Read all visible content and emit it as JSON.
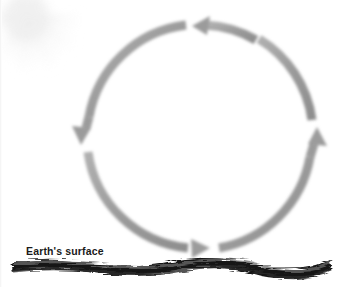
{
  "figure": {
    "width": 337,
    "height": 287,
    "background_color": "#ffffff"
  },
  "labels": {
    "surface": "Earth's surface"
  },
  "colors": {
    "arrow_gray": "#9a9a9a",
    "arrow_gray_light": "#b4b4b4",
    "arrow_gray_dark": "#808080",
    "ground_dark": "#1a1a1a",
    "ground_mid": "#5c5c5c",
    "sun_tint": "#e9e9e9",
    "label_text": "#1a1a1a"
  },
  "sun": {
    "name": "sun",
    "center_x": 26,
    "center_y": 18,
    "core_radius": 30,
    "ray_count": 12,
    "ray_length": 44,
    "opacity": 0.55
  },
  "cycle": {
    "name": "convection-cycle",
    "direction": "counterclockwise",
    "center_x": 200,
    "center_y": 137,
    "radius": 112,
    "stroke_width": 9,
    "arrows": [
      {
        "id": "top-arrow",
        "name": "cycle-arrow-top",
        "points": "left",
        "glyph": "←",
        "start_angle": 300,
        "end_angle": 188,
        "tip_x": 193,
        "tip_y": 26
      },
      {
        "id": "left-arrow",
        "name": "cycle-arrow-left",
        "points": "down",
        "glyph": "↓",
        "start_angle": 182,
        "end_angle": 93,
        "tip_x": 82,
        "tip_y": 144
      },
      {
        "id": "bottom-arrow",
        "name": "cycle-arrow-bottom",
        "points": "right",
        "glyph": "→",
        "start_angle": 87,
        "end_angle": 4,
        "tip_x": 208,
        "tip_y": 248
      },
      {
        "id": "right-arrow",
        "name": "cycle-arrow-right",
        "points": "up",
        "glyph": "↑",
        "start_angle": 358,
        "end_angle": 274,
        "tip_x": 317,
        "tip_y": 128
      }
    ]
  },
  "ground": {
    "name": "earth-surface-band",
    "left_x": 12,
    "right_x": 331,
    "top_y": 261,
    "bottom_y": 273,
    "thickness": 11,
    "style": "irregular-wavy-dark-band"
  }
}
